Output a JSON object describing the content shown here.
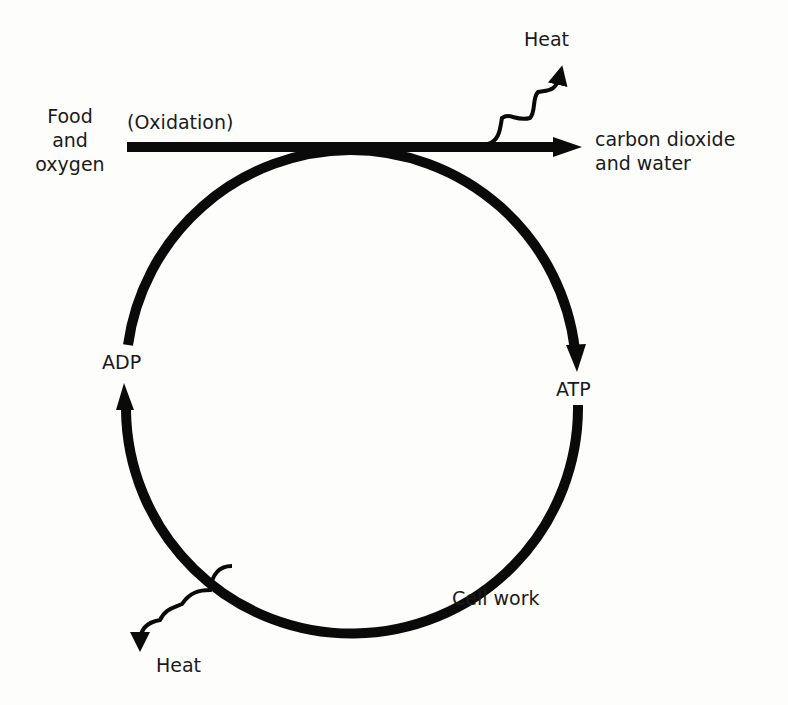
{
  "diagram": {
    "type": "ATP-ADP cycle",
    "labels": {
      "food_line1": "Food",
      "food_line2": "and",
      "food_line3": "oxygen",
      "oxidation": "(Oxidation)",
      "products_line1": "carbon dioxide",
      "products_line2": "and water",
      "heat_top": "Heat",
      "adp": "ADP",
      "atp": "ATP",
      "cell_work": "Cell work",
      "heat_bottom": "Heat"
    },
    "colors": {
      "stroke": "#0a0a0a",
      "text": "#1a1a1a",
      "background": "#fdfdfc"
    }
  }
}
